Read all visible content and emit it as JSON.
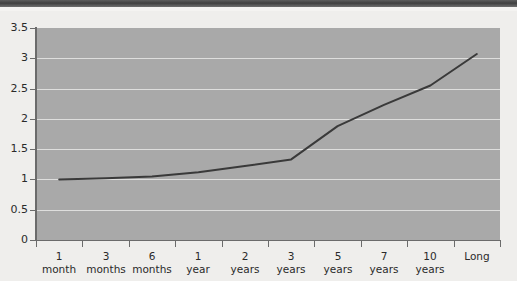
{
  "chart_data": {
    "type": "line",
    "title": "",
    "subtitle": "",
    "xlabel": "",
    "ylabel": "",
    "categories": [
      "1 month",
      "3 months",
      "6 months",
      "1 year",
      "2 years",
      "3 years",
      "5 years",
      "7 years",
      "10 years",
      "Long"
    ],
    "category_lines": [
      [
        "1",
        "month"
      ],
      [
        "3",
        "months"
      ],
      [
        "6",
        "months"
      ],
      [
        "1",
        "year"
      ],
      [
        "2",
        "years"
      ],
      [
        "3",
        "years"
      ],
      [
        "5",
        "years"
      ],
      [
        "7",
        "years"
      ],
      [
        "10",
        "years"
      ],
      [
        "Long",
        ""
      ]
    ],
    "values": [
      1.0,
      1.02,
      1.05,
      1.12,
      1.22,
      1.33,
      1.88,
      2.23,
      2.55,
      3.07
    ],
    "series": [
      {
        "name": "yield",
        "values": [
          1.0,
          1.02,
          1.05,
          1.12,
          1.22,
          1.33,
          1.88,
          2.23,
          2.55,
          3.07
        ],
        "color": "#3a3a3a"
      }
    ],
    "ylim": [
      0,
      3.5
    ],
    "ytick_labels": [
      "0",
      "0.5",
      "1",
      "1.5",
      "2",
      "2.5",
      "3",
      "3.5"
    ],
    "ytick_values": [
      0,
      0.5,
      1,
      1.5,
      2,
      2.5,
      3,
      3.5
    ],
    "grid": true,
    "grid_axis": "y",
    "legend": "none",
    "plot_background": "#a9a9a9",
    "grid_color": "#e8e8e6",
    "axis_color": "#6b6b6b",
    "line_color": "#3a3a3a",
    "page_background": "#efeeec"
  }
}
